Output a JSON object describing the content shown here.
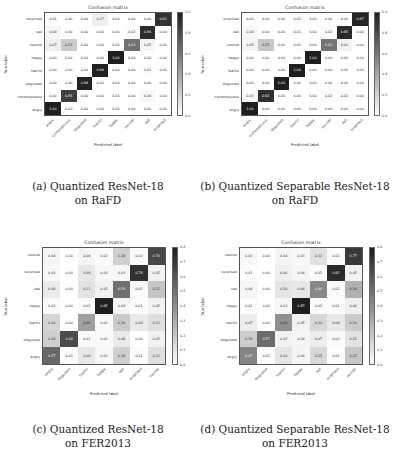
{
  "figures": [
    {
      "id": "a",
      "title": "Confusion matrix",
      "ylabel": "True label",
      "xlabel": "Predicted label",
      "caption_line1": "(a) Quantized ResNet-18",
      "caption_line2": "on RaFD",
      "rows": [
        "surprised",
        "sad",
        "neutral",
        "happy",
        "fearful",
        "disgusted",
        "contemptuous",
        "angry"
      ],
      "cols": [
        "angry",
        "contemptuous",
        "disgusted",
        "fearful",
        "happy",
        "neutral",
        "sad",
        "surprised"
      ],
      "cbar_ticks": [
        "1.0",
        "0.8",
        "0.6",
        "0.4",
        "0.2",
        "0.0"
      ],
      "cbar_max": 1.0
    },
    {
      "id": "b",
      "title": "Confusion matrix",
      "ylabel": "True label",
      "xlabel": "Predicted label",
      "caption_line1": "(b) Quantized Separable ResNet-18",
      "caption_line2": "on RaFD",
      "rows": [
        "surprised",
        "sad",
        "neutral",
        "happy",
        "fearful",
        "disgusted",
        "contemptuous",
        "angry"
      ],
      "cols": [
        "angry",
        "contemptuous",
        "disgusted",
        "fearful",
        "happy",
        "neutral",
        "sad",
        "surprised"
      ],
      "cbar_ticks": [
        "1.0",
        "0.8",
        "0.6",
        "0.4",
        "0.2",
        "0.0"
      ],
      "cbar_max": 1.0
    },
    {
      "id": "c",
      "title": "Confusion matrix",
      "ylabel": "True label",
      "xlabel": "Predicted label",
      "caption_line1": "(c) Quantized ResNet-18",
      "caption_line2": "on FER2013",
      "rows": [
        "neutral",
        "surprised",
        "sad",
        "happy",
        "fearful",
        "disgusted",
        "angry"
      ],
      "cols": [
        "angry",
        "disgusted",
        "fearful",
        "happy",
        "sad",
        "surprised",
        "neutral"
      ],
      "cbar_ticks": [
        "0.8",
        "0.7",
        "0.6",
        "0.5",
        "0.4",
        "0.3",
        "0.2",
        "0.1",
        "0.0"
      ],
      "cbar_max": 0.85
    },
    {
      "id": "d",
      "title": "Confusion matrix",
      "ylabel": "True label",
      "xlabel": "Predicted label",
      "caption_line1": "(d) Quantized Separable ResNet-18",
      "caption_line2": "on FER2013",
      "rows": [
        "neutral",
        "surprised",
        "sad",
        "happy",
        "fearful",
        "disgusted",
        "angry"
      ],
      "cols": [
        "angry",
        "disgusted",
        "fearful",
        "happy",
        "sad",
        "surprised",
        "neutral"
      ],
      "cbar_ticks": [
        "0.8",
        "0.7",
        "0.6",
        "0.5",
        "0.4",
        "0.3",
        "0.2",
        "0.1",
        "0.0"
      ],
      "cbar_max": 0.87
    }
  ],
  "chart_data": [
    {
      "type": "heatmap",
      "title": "Confusion matrix",
      "subtitle": "(a) Quantized ResNet-18 on RaFD",
      "xlabel": "Predicted label",
      "ylabel": "True label",
      "x": [
        "angry",
        "contemptuous",
        "disgusted",
        "fearful",
        "happy",
        "neutral",
        "sad",
        "surprised"
      ],
      "y": [
        "surprised",
        "sad",
        "neutral",
        "happy",
        "fearful",
        "disgusted",
        "contemptuous",
        "angry"
      ],
      "values": [
        [
          0.01,
          0.0,
          0.0,
          0.07,
          0.0,
          0.0,
          0.0,
          0.91
        ],
        [
          0.04,
          0.0,
          0.0,
          0.0,
          0.0,
          0.02,
          0.94,
          0.0
        ],
        [
          0.07,
          0.23,
          0.0,
          0.0,
          0.0,
          0.63,
          0.05,
          0.0
        ],
        [
          0.0,
          0.0,
          0.0,
          0.0,
          1.0,
          0.0,
          0.0,
          0.0
        ],
        [
          0.0,
          0.0,
          0.0,
          0.99,
          0.0,
          0.0,
          0.01,
          0.0
        ],
        [
          0.0,
          0.0,
          0.98,
          0.0,
          0.0,
          0.0,
          0.0,
          0.0
        ],
        [
          0.0,
          0.85,
          0.0,
          0.0,
          0.01,
          0.0,
          0.04,
          0.0
        ],
        [
          1.0,
          0.0,
          0.0,
          0.0,
          0.0,
          0.0,
          0.0,
          0.0
        ]
      ],
      "colorbar_range": [
        0.0,
        1.0
      ]
    },
    {
      "type": "heatmap",
      "title": "Confusion matrix",
      "subtitle": "(b) Quantized Separable ResNet-18 on RaFD",
      "xlabel": "Predicted label",
      "ylabel": "True label",
      "x": [
        "angry",
        "contemptuous",
        "disgusted",
        "fearful",
        "happy",
        "neutral",
        "sad",
        "surprised"
      ],
      "y": [
        "surprised",
        "sad",
        "neutral",
        "happy",
        "fearful",
        "disgusted",
        "contemptuous",
        "angry"
      ],
      "values": [
        [
          0.0,
          0.0,
          0.0,
          0.02,
          0.0,
          0.0,
          0.0,
          0.97
        ],
        [
          0.04,
          0.0,
          0.0,
          0.01,
          0.0,
          0.02,
          0.95,
          0.0
        ],
        [
          0.05,
          0.25,
          0.0,
          0.01,
          0.0,
          0.62,
          0.06,
          0.0
        ],
        [
          0.0,
          0.0,
          0.0,
          0.0,
          1.0,
          0.0,
          0.0,
          0.0
        ],
        [
          0.0,
          0.0,
          0.0,
          1.0,
          0.0,
          0.0,
          0.0,
          0.0
        ],
        [
          0.0,
          0.0,
          1.0,
          0.0,
          0.0,
          0.0,
          0.0,
          0.0
        ],
        [
          0.03,
          0.92,
          0.0,
          0.0,
          0.0,
          0.02,
          0.02,
          0.0
        ],
        [
          1.0,
          0.0,
          0.0,
          0.0,
          0.0,
          0.0,
          0.0,
          0.0
        ]
      ],
      "colorbar_range": [
        0.0,
        1.0
      ]
    },
    {
      "type": "heatmap",
      "title": "Confusion matrix",
      "subtitle": "(c) Quantized ResNet-18 on FER2013",
      "xlabel": "Predicted label",
      "ylabel": "True label",
      "x": [
        "angry",
        "disgusted",
        "fearful",
        "happy",
        "sad",
        "surprised",
        "neutral"
      ],
      "y": [
        "neutral",
        "surprised",
        "sad",
        "happy",
        "fearful",
        "disgusted",
        "angry"
      ],
      "values": [
        [
          0.04,
          0.0,
          0.04,
          0.02,
          0.18,
          0.02,
          0.7
        ],
        [
          0.03,
          0.0,
          0.09,
          0.03,
          0.03,
          0.78,
          0.05
        ],
        [
          0.08,
          0.0,
          0.11,
          0.05,
          0.54,
          0.02,
          0.22
        ],
        [
          0.02,
          0.0,
          0.02,
          0.85,
          0.04,
          0.01,
          0.05
        ],
        [
          0.16,
          0.0,
          0.36,
          0.02,
          0.2,
          0.08,
          0.12
        ],
        [
          0.18,
          0.68,
          0.02,
          0.02,
          0.08,
          0.0,
          0.05
        ],
        [
          0.57,
          0.01,
          0.09,
          0.03,
          0.18,
          0.01,
          0.12
        ]
      ],
      "colorbar_range": [
        0.0,
        0.85
      ]
    },
    {
      "type": "heatmap",
      "title": "Confusion matrix",
      "subtitle": "(d) Quantized Separable ResNet-18 on FER2013",
      "xlabel": "Predicted label",
      "ylabel": "True label",
      "x": [
        "angry",
        "disgusted",
        "fearful",
        "happy",
        "sad",
        "surprised",
        "neutral"
      ],
      "y": [
        "neutral",
        "surprised",
        "sad",
        "happy",
        "fearful",
        "disgusted",
        "angry"
      ],
      "values": [
        [
          0.03,
          0.0,
          0.04,
          0.03,
          0.12,
          0.01,
          0.77
        ],
        [
          0.01,
          0.0,
          0.06,
          0.04,
          0.02,
          0.82,
          0.05
        ],
        [
          0.04,
          0.0,
          0.1,
          0.09,
          0.46,
          0.02,
          0.3
        ],
        [
          0.01,
          0.0,
          0.03,
          0.87,
          0.02,
          0.01,
          0.06
        ],
        [
          0.07,
          0.0,
          0.43,
          0.05,
          0.16,
          0.09,
          0.2
        ],
        [
          0.19,
          0.57,
          0.05,
          0.04,
          0.07,
          0.02,
          0.11
        ],
        [
          0.47,
          0.01,
          0.1,
          0.04,
          0.15,
          0.01,
          0.22
        ]
      ],
      "colorbar_range": [
        0.0,
        0.87
      ]
    }
  ]
}
